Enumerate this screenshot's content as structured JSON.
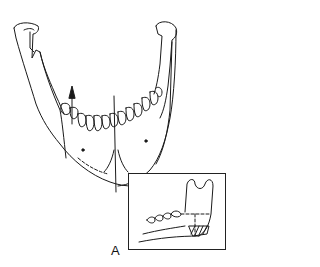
{
  "figure": {
    "stroke_color": "#1a1a1a",
    "background_color": "#ffffff",
    "arrow_direction": "up"
  },
  "inset": {
    "subject": "mandible-lateral-view-with-hatched-region",
    "label": "A"
  }
}
